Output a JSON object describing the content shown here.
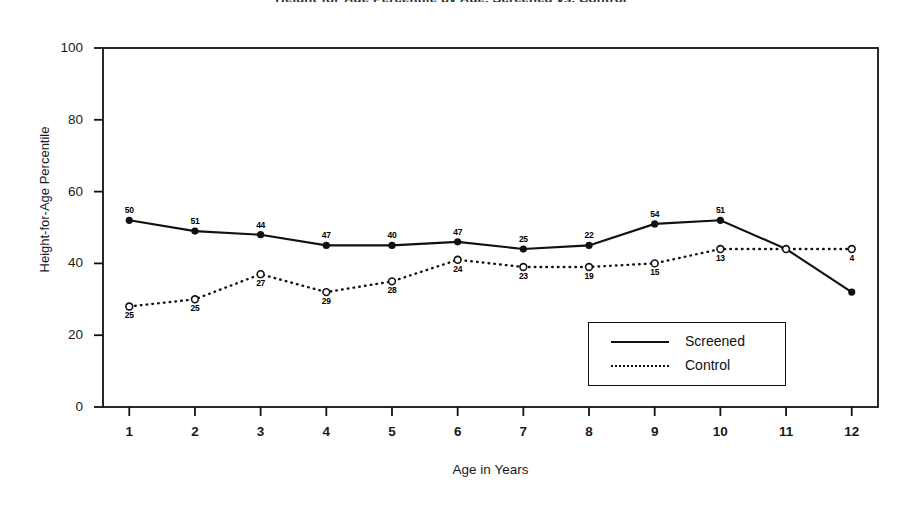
{
  "figure": {
    "title_remnant": "Height-for-Age Percentile by Age, Screened vs. Control",
    "axis": {
      "xlabel": "Age in Years",
      "ylabel": "Height-for-Age Percentile",
      "yticks": [
        "0",
        "20",
        "40",
        "60",
        "80",
        "100"
      ],
      "xticks": [
        "1",
        "2",
        "3",
        "4",
        "5",
        "6",
        "7",
        "8",
        "9",
        "10",
        "11",
        "12"
      ]
    },
    "legend": {
      "items": [
        {
          "label": "Screened",
          "style": "solid"
        },
        {
          "label": "Control",
          "style": "dotted"
        }
      ]
    }
  },
  "chart_data": {
    "type": "line",
    "title": "Height-for-Age Percentile by Age, Screened vs. Control",
    "xlabel": "Age in Years",
    "ylabel": "Height-for-Age Percentile",
    "x": [
      1,
      2,
      3,
      4,
      5,
      6,
      7,
      8,
      9,
      10,
      11,
      12
    ],
    "categories": [
      "1",
      "2",
      "3",
      "4",
      "5",
      "6",
      "7",
      "8",
      "9",
      "10",
      "11",
      "12"
    ],
    "xlim": [
      0.6,
      12.4
    ],
    "ylim": [
      0,
      100
    ],
    "yticks": [
      0,
      20,
      40,
      60,
      80,
      100
    ],
    "xticks": [
      1,
      2,
      3,
      4,
      5,
      6,
      7,
      8,
      9,
      10,
      11,
      12
    ],
    "grid": false,
    "legend_position": "lower-right-inside",
    "series": [
      {
        "name": "Screened",
        "style": "solid",
        "marker": "filled-circle",
        "values": [
          52,
          49,
          48,
          45,
          45,
          46,
          44,
          45,
          51,
          52,
          44,
          32
        ],
        "point_labels": [
          "50",
          "51",
          "44",
          "47",
          "40",
          "47",
          "25",
          "22",
          "54",
          "51",
          "",
          ""
        ]
      },
      {
        "name": "Control",
        "style": "dotted",
        "marker": "open-circle",
        "values": [
          28,
          30,
          37,
          32,
          35,
          41,
          39,
          39,
          40,
          44,
          44,
          44
        ],
        "point_labels": [
          "25",
          "25",
          "27",
          "29",
          "28",
          "24",
          "23",
          "19",
          "15",
          "13",
          "",
          "4"
        ]
      }
    ]
  }
}
